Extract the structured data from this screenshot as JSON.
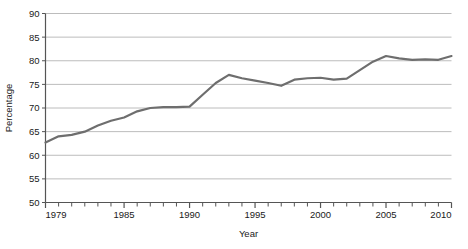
{
  "chart_data": {
    "type": "line",
    "title": "",
    "xlabel": "Year",
    "ylabel": "Percentage",
    "xlim": [
      1979,
      2010
    ],
    "ylim": [
      50,
      90
    ],
    "ytick_values": [
      50,
      55,
      60,
      65,
      70,
      75,
      80,
      85,
      90
    ],
    "ytick_labels": [
      "50",
      "55",
      "60",
      "65",
      "70",
      "75",
      "80",
      "85",
      "90"
    ],
    "xtick_values": [
      1979,
      1985,
      1990,
      1995,
      2000,
      2005,
      2010
    ],
    "xtick_labels": [
      "1979",
      "1985",
      "1990",
      "1995",
      "2000",
      "2005",
      "2010"
    ],
    "minor_xticks_every": 1,
    "grid": "horizontal",
    "legend": "none",
    "line_color": "#6e6e6e",
    "grid_color": "#bcbcbc",
    "axis_color": "#555555",
    "x": [
      1979,
      1980,
      1981,
      1982,
      1983,
      1984,
      1985,
      1986,
      1987,
      1988,
      1989,
      1990,
      1991,
      1992,
      1993,
      1994,
      1995,
      1996,
      1997,
      1998,
      1999,
      2000,
      2001,
      2002,
      2003,
      2004,
      2005,
      2006,
      2007,
      2008,
      2009,
      2010
    ],
    "values": [
      62.7,
      64.0,
      64.3,
      65.0,
      66.3,
      67.3,
      68.0,
      69.3,
      70.0,
      70.2,
      70.2,
      70.3,
      72.8,
      75.3,
      77.0,
      76.3,
      75.8,
      75.3,
      74.7,
      76.0,
      76.3,
      76.4,
      76.0,
      76.2,
      78.0,
      79.8,
      81.0,
      80.5,
      80.2,
      80.3,
      80.2,
      81.0
    ],
    "series": [
      {
        "name": "Percentage",
        "values": [
          62.7,
          64.0,
          64.3,
          65.0,
          66.3,
          67.3,
          68.0,
          69.3,
          70.0,
          70.2,
          70.2,
          70.3,
          72.8,
          75.3,
          77.0,
          76.3,
          75.8,
          75.3,
          74.7,
          76.0,
          76.3,
          76.4,
          76.0,
          76.2,
          78.0,
          79.8,
          81.0,
          80.5,
          80.2,
          80.3,
          80.2,
          81.0
        ]
      }
    ]
  }
}
